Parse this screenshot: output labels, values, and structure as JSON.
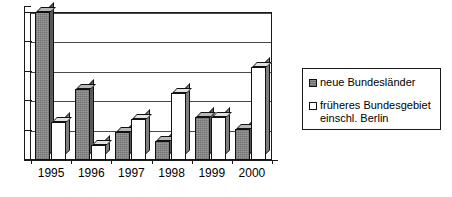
{
  "chart_data": {
    "type": "bar",
    "title": "",
    "xlabel": "",
    "ylabel": "",
    "categories": [
      "1995",
      "1996",
      "1997",
      "1998",
      "1999",
      "2000"
    ],
    "ylim": [
      0,
      5
    ],
    "yticks": [
      0,
      1,
      2,
      3,
      4,
      5
    ],
    "ytick_labels": [
      "0",
      "1",
      "2",
      "3",
      "4",
      "5"
    ],
    "grid": true,
    "grid_axis": "y",
    "legend_position": "right",
    "series": [
      {
        "name": "neue Bundesländer",
        "color": "#9a9a9a",
        "values": [
          5.0,
          2.4,
          0.95,
          0.65,
          1.45,
          1.05
        ]
      },
      {
        "name": "früheres Bundesgebiet einschl. Berlin",
        "color": "#ffffff",
        "values": [
          1.3,
          0.5,
          1.4,
          2.25,
          1.45,
          3.15
        ]
      }
    ]
  },
  "legend": {
    "entries": [
      {
        "label": "neue Bundesländer",
        "swatch": "filled-gray-square"
      },
      {
        "label": "früheres Bundesgebiet\neinschl. Berlin",
        "swatch": "empty-white-square"
      }
    ]
  }
}
